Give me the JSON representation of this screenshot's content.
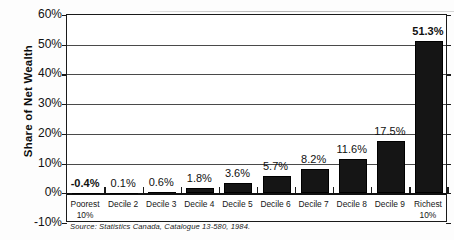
{
  "chart_data": {
    "type": "bar",
    "title": "",
    "xlabel": "",
    "ylabel": "Share of Net Wealth",
    "ylim": [
      -10,
      60
    ],
    "ytick_labels": [
      "60%",
      "50%",
      "40%",
      "30%",
      "20%",
      "10%",
      "0%",
      "-10%"
    ],
    "ytick_values": [
      60,
      50,
      40,
      30,
      20,
      10,
      0,
      -10
    ],
    "grid": true,
    "legend": false,
    "categories": [
      "Poorest 10%",
      "Decile 2",
      "Decile 3",
      "Decile 4",
      "Decile 5",
      "Decile 6",
      "Decile 7",
      "Decile 8",
      "Decile 9",
      "Richest 10%"
    ],
    "category_lines": [
      [
        "Poorest",
        "10%"
      ],
      [
        "Decile 2",
        ""
      ],
      [
        "Decile 3",
        ""
      ],
      [
        "Decile 4",
        ""
      ],
      [
        "Decile 5",
        ""
      ],
      [
        "Decile 6",
        ""
      ],
      [
        "Decile 7",
        ""
      ],
      [
        "Decile 8",
        ""
      ],
      [
        "Decile 9",
        ""
      ],
      [
        "Richest",
        "10%"
      ]
    ],
    "values": [
      -0.4,
      0.1,
      0.6,
      1.8,
      3.6,
      5.7,
      8.2,
      11.6,
      17.5,
      51.3
    ],
    "data_labels": [
      "-0.4%",
      "0.1%",
      "0.6%",
      "1.8%",
      "3.6%",
      "5.7%",
      "8.2%",
      "11.6%",
      "17.5%",
      "51.3%"
    ],
    "data_label_bold": [
      true,
      false,
      false,
      false,
      false,
      false,
      false,
      false,
      false,
      true
    ],
    "bar_color": "#151515",
    "annotations": {
      "source": "Source: Statistics Canada, Catalogue 13-580, 1984."
    }
  }
}
